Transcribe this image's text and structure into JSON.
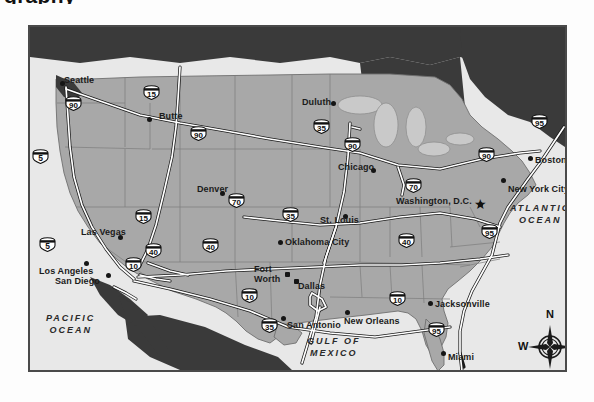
{
  "page": {
    "cut_off_heading": "graphy",
    "background_color": "#ffffff"
  },
  "map": {
    "frame_color": "#4a4a4a",
    "land_color": "#a8a8a8",
    "foreign_land_color": "#3a3a3a",
    "water_color": "#e8e8e8",
    "lake_color": "#c9c9c9",
    "highway_color": "#ffffff",
    "highway_outline": "#1a1a1a",
    "oceans": [
      {
        "name": "pacific-ocean",
        "line1": "PACIFIC",
        "line2": "OCEAN",
        "x": 44,
        "y": 310
      },
      {
        "name": "atlantic-ocean",
        "line1": "ATLANTIC",
        "line2": "OCEAN",
        "x": 508,
        "y": 200
      },
      {
        "name": "gulf-of-mexico",
        "line1": "GULF OF",
        "line2": "MEXICO",
        "x": 305,
        "y": 333
      }
    ],
    "cities": [
      {
        "name": "seattle",
        "label": "Seattle",
        "dot_x": 60,
        "dot_y": 81,
        "lx": 62,
        "ly": 74,
        "anchor": "left",
        "capital": false
      },
      {
        "name": "butte",
        "label": "Butte",
        "dot_x": 147,
        "dot_y": 117,
        "lx": 157,
        "ly": 110,
        "anchor": "left",
        "capital": false
      },
      {
        "name": "duluth",
        "label": "Duluth",
        "dot_x": 331,
        "dot_y": 101,
        "lx": 300,
        "ly": 96,
        "anchor": "left",
        "capital": false
      },
      {
        "name": "chicago",
        "label": "Chicago",
        "dot_x": 371,
        "dot_y": 168,
        "lx": 336,
        "ly": 161,
        "anchor": "left",
        "capital": false
      },
      {
        "name": "boston",
        "label": "Boston",
        "dot_x": 528,
        "dot_y": 156,
        "lx": 533,
        "ly": 154,
        "anchor": "left",
        "capital": false
      },
      {
        "name": "new-york-city",
        "label": "New York City",
        "dot_x": 501,
        "dot_y": 178,
        "lx": 506,
        "ly": 183,
        "anchor": "left",
        "capital": false
      },
      {
        "name": "washington-dc",
        "label": "Washington, D.C.",
        "dot_x": 478,
        "dot_y": 202,
        "lx": 394,
        "ly": 195,
        "anchor": "left",
        "capital": true
      },
      {
        "name": "denver",
        "label": "Denver",
        "dot_x": 220,
        "dot_y": 191,
        "lx": 195,
        "ly": 183,
        "anchor": "left",
        "capital": false
      },
      {
        "name": "st-louis",
        "label": "St. Louis",
        "dot_x": 343,
        "dot_y": 214,
        "lx": 318,
        "ly": 214,
        "anchor": "left",
        "capital": false
      },
      {
        "name": "las-vegas",
        "label": "Las Vegas",
        "dot_x": 118,
        "dot_y": 235,
        "lx": 79,
        "ly": 226,
        "anchor": "left",
        "capital": false
      },
      {
        "name": "oklahoma-city",
        "label": "Oklahoma City",
        "dot_x": 278,
        "dot_y": 240,
        "lx": 283,
        "ly": 236,
        "anchor": "left",
        "capital": false
      },
      {
        "name": "los-angeles",
        "label": "Los Angeles",
        "dot_x": 84,
        "dot_y": 261,
        "lx": 37,
        "ly": 265,
        "anchor": "left",
        "capital": false
      },
      {
        "name": "san-diego",
        "label": "San Diego",
        "dot_x": 106,
        "dot_y": 273,
        "lx": 53,
        "ly": 275,
        "anchor": "left",
        "capital": false
      },
      {
        "name": "fort-worth",
        "label": "Fort\nWorth",
        "dot_x": 285,
        "dot_y": 272,
        "lx": 252,
        "ly": 262,
        "anchor": "left",
        "capital": false
      },
      {
        "name": "dallas",
        "label": "Dallas",
        "dot_x": 294,
        "dot_y": 279,
        "lx": 296,
        "ly": 280,
        "anchor": "left",
        "capital": false
      },
      {
        "name": "san-antonio",
        "label": "San Antonio",
        "dot_x": 281,
        "dot_y": 316,
        "lx": 285,
        "ly": 319,
        "anchor": "left",
        "capital": false
      },
      {
        "name": "new-orleans",
        "label": "New Orleans",
        "dot_x": 345,
        "dot_y": 310,
        "lx": 342,
        "ly": 315,
        "anchor": "left",
        "capital": false
      },
      {
        "name": "jacksonville",
        "label": "Jacksonville",
        "dot_x": 428,
        "dot_y": 301,
        "lx": 433,
        "ly": 298,
        "anchor": "left",
        "capital": false
      },
      {
        "name": "miami",
        "label": "Miami",
        "dot_x": 441,
        "dot_y": 351,
        "lx": 446,
        "ly": 351,
        "anchor": "left",
        "capital": false
      }
    ],
    "interstates": [
      {
        "name": "i-5-north",
        "number": "5",
        "x": 38,
        "y": 154
      },
      {
        "name": "i-90-west",
        "number": "90",
        "x": 71,
        "y": 101
      },
      {
        "name": "i-15-north",
        "number": "15",
        "x": 149,
        "y": 90
      },
      {
        "name": "i-90-dakota",
        "number": "90",
        "x": 196,
        "y": 131
      },
      {
        "name": "i-35-north",
        "number": "35",
        "x": 319,
        "y": 124
      },
      {
        "name": "i-90-chicago",
        "number": "90",
        "x": 350,
        "y": 142
      },
      {
        "name": "i-90-east",
        "number": "90",
        "x": 484,
        "y": 152
      },
      {
        "name": "i-95-north",
        "number": "95",
        "x": 537,
        "y": 119
      },
      {
        "name": "i-70-east",
        "number": "70",
        "x": 411,
        "y": 183
      },
      {
        "name": "i-70-denver",
        "number": "70",
        "x": 234,
        "y": 198
      },
      {
        "name": "i-35-central",
        "number": "35",
        "x": 288,
        "y": 212
      },
      {
        "name": "i-95-dc",
        "number": "95",
        "x": 487,
        "y": 229
      },
      {
        "name": "i-15-vegas",
        "number": "15",
        "x": 141,
        "y": 214
      },
      {
        "name": "i-40-west",
        "number": "40",
        "x": 151,
        "y": 248
      },
      {
        "name": "i-40-central",
        "number": "40",
        "x": 208,
        "y": 243
      },
      {
        "name": "i-40-east",
        "number": "40",
        "x": 404,
        "y": 238
      },
      {
        "name": "i-5-socal",
        "number": "5",
        "x": 45,
        "y": 242
      },
      {
        "name": "i-10-west",
        "number": "10",
        "x": 131,
        "y": 262
      },
      {
        "name": "i-10-texas",
        "number": "10",
        "x": 247,
        "y": 293
      },
      {
        "name": "i-10-east",
        "number": "10",
        "x": 395,
        "y": 296
      },
      {
        "name": "i-35-texas",
        "number": "35",
        "x": 267,
        "y": 323
      },
      {
        "name": "i-95-florida",
        "number": "95",
        "x": 434,
        "y": 327
      }
    ],
    "compass": {
      "north": "N",
      "south": "S",
      "east": "E",
      "west": "W"
    }
  }
}
